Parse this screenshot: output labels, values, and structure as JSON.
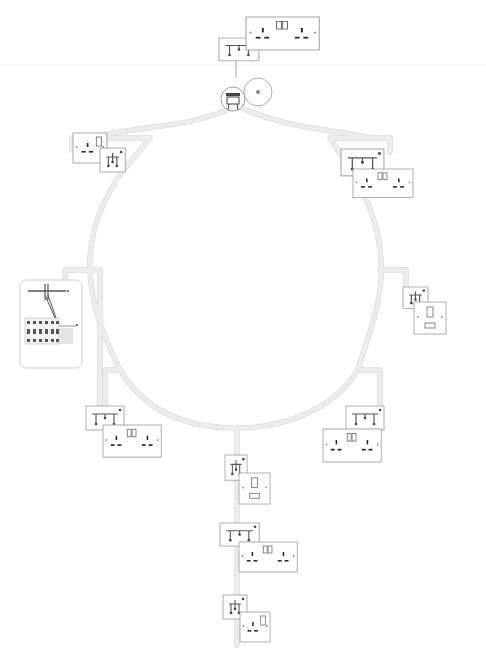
{
  "diagram": {
    "title": "",
    "type": "ring-main-wiring",
    "colors": {
      "background": "#ffffff",
      "cable": "#ececec",
      "outline": "#9a9a9a",
      "pin": "#2b2b2b"
    },
    "consumer_unit": {
      "x": 20,
      "y": 280,
      "w": 60,
      "h": 88,
      "breakers": 6
    },
    "fused_spur": {
      "x": 222,
      "y": 86,
      "r": 15
    },
    "ceiling_rose": {
      "x": 257,
      "y": 95,
      "r": 17
    },
    "ring": {
      "cx": 237,
      "cy": 255,
      "rx": 128,
      "ry": 135
    },
    "outlets": [
      {
        "id": "top-double",
        "type": "double-switched",
        "plate": {
          "x": 229,
          "y": 8,
          "w": 75,
          "h": 44
        },
        "jbox": {
          "x": 219,
          "y": 38,
          "w": 40,
          "h": 23
        }
      },
      {
        "id": "upper-left-single",
        "type": "single-switched",
        "plate": {
          "x": 73,
          "y": 133,
          "w": 34,
          "h": 30
        },
        "jbox": {
          "x": 100,
          "y": 148,
          "w": 25,
          "h": 24
        }
      },
      {
        "id": "upper-right-double",
        "type": "double-switched",
        "plate": {
          "x": 353,
          "y": 169,
          "w": 60,
          "h": 28
        },
        "jbox": {
          "x": 341,
          "y": 149,
          "w": 43,
          "h": 27
        }
      },
      {
        "id": "right-fused",
        "type": "fused-connection-unit",
        "plate": {
          "x": 414,
          "y": 302,
          "w": 33,
          "h": 32
        },
        "jbox": {
          "x": 403,
          "y": 287,
          "w": 25,
          "h": 21
        }
      },
      {
        "id": "lower-left-double",
        "type": "double-switched",
        "plate": {
          "x": 103,
          "y": 425,
          "w": 58,
          "h": 32
        },
        "jbox": {
          "x": 86,
          "y": 406,
          "w": 38,
          "h": 24
        }
      },
      {
        "id": "lower-right-double",
        "type": "double-switched",
        "plate": {
          "x": 323,
          "y": 429,
          "w": 58,
          "h": 33
        },
        "jbox": {
          "x": 346,
          "y": 406,
          "w": 38,
          "h": 24
        }
      },
      {
        "id": "spur-1-fused",
        "type": "fused-connection-unit",
        "plate": {
          "x": 239,
          "y": 473,
          "w": 31,
          "h": 31
        },
        "jbox": {
          "x": 225,
          "y": 455,
          "w": 22,
          "h": 25
        }
      },
      {
        "id": "spur-2-double",
        "type": "double-switched",
        "plate": {
          "x": 239,
          "y": 542,
          "w": 58,
          "h": 30
        },
        "jbox": {
          "x": 220,
          "y": 523,
          "w": 39,
          "h": 23
        }
      },
      {
        "id": "spur-3-single",
        "type": "single-switched",
        "plate": {
          "x": 240,
          "y": 612,
          "w": 30,
          "h": 30
        },
        "jbox": {
          "x": 223,
          "y": 595,
          "w": 24,
          "h": 24
        }
      }
    ]
  }
}
